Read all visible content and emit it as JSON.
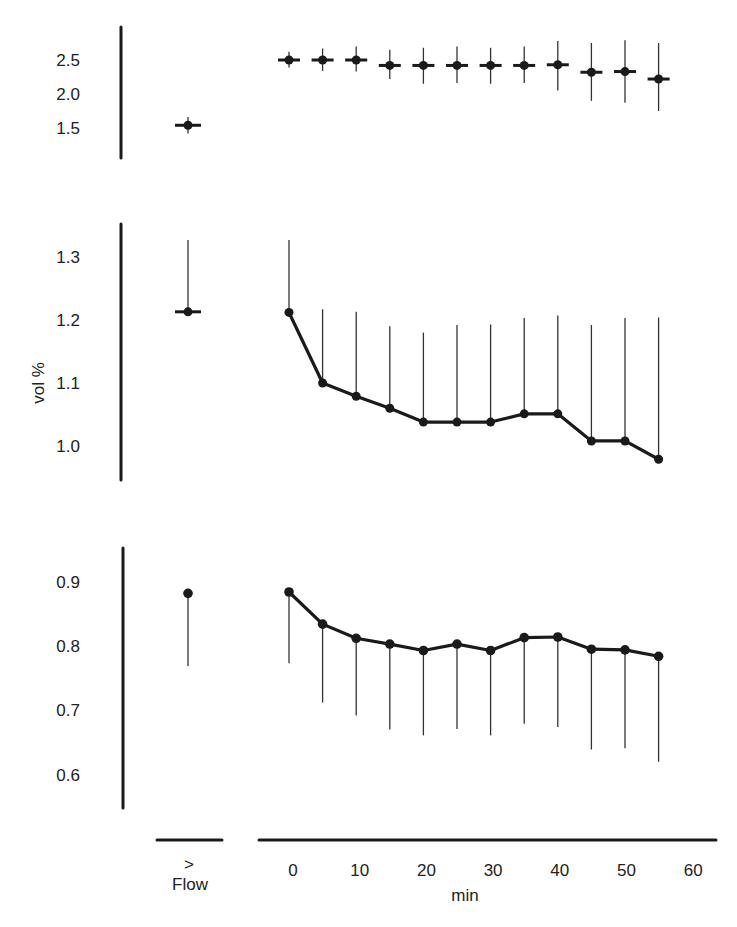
{
  "chart_data": {
    "type": "line",
    "xlabel": "min",
    "flow_label": "Flow",
    "flow_marker": ">",
    "x_ticks": [
      "0",
      "10",
      "20",
      "30",
      "40",
      "50",
      "60"
    ],
    "x_range": [
      0,
      60
    ],
    "time_points": [
      0,
      5,
      10,
      15,
      20,
      25,
      30,
      35,
      40,
      45,
      50,
      55
    ],
    "panels": [
      {
        "id": "top",
        "ylabel": "",
        "y_ticks": [
          "2.5",
          "2.0",
          "1.5"
        ],
        "ylim": [
          1.2,
          2.95
        ],
        "connected": false,
        "flow": {
          "value": 1.54,
          "err_upper": 1.66,
          "err_lower": 1.42
        },
        "values": [
          2.5,
          2.5,
          2.5,
          2.42,
          2.42,
          2.42,
          2.42,
          2.42,
          2.43,
          2.32,
          2.33,
          2.22
        ],
        "err_upper": [
          2.62,
          2.67,
          2.7,
          2.65,
          2.68,
          2.7,
          2.68,
          2.7,
          2.78,
          2.75,
          2.79,
          2.75
        ],
        "err_lower": [
          2.39,
          2.34,
          2.33,
          2.22,
          2.15,
          2.16,
          2.15,
          2.16,
          2.05,
          1.9,
          1.87,
          1.75
        ]
      },
      {
        "id": "middle",
        "ylabel": "vol %",
        "y_ticks": [
          "1.3",
          "1.2",
          "1.1",
          "1.0"
        ],
        "ylim": [
          0.95,
          1.36
        ],
        "connected": true,
        "flow": {
          "value": 1.213,
          "err_upper": 1.327,
          "err_lower": null
        },
        "values": [
          1.212,
          1.1,
          1.079,
          1.06,
          1.038,
          1.038,
          1.038,
          1.051,
          1.051,
          1.008,
          1.008,
          0.979
        ],
        "err_upper": [
          1.327,
          1.217,
          1.213,
          1.19,
          1.18,
          1.192,
          1.193,
          1.203,
          1.207,
          1.192,
          1.203,
          1.204
        ],
        "err_lower": null
      },
      {
        "id": "bottom",
        "ylabel": "",
        "y_ticks": [
          "0.9",
          "0.8",
          "0.7",
          "0.6"
        ],
        "ylim": [
          0.55,
          0.95
        ],
        "connected": true,
        "flow": {
          "value": 0.882,
          "err_upper": null,
          "err_lower": 0.769
        },
        "values": [
          0.884,
          0.834,
          0.812,
          0.803,
          0.793,
          0.803,
          0.793,
          0.813,
          0.814,
          0.795,
          0.794,
          0.784
        ],
        "err_upper": null,
        "err_lower": [
          0.773,
          0.712,
          0.692,
          0.67,
          0.661,
          0.671,
          0.661,
          0.679,
          0.674,
          0.639,
          0.641,
          0.62
        ]
      }
    ],
    "grid": false,
    "legend": "none"
  }
}
